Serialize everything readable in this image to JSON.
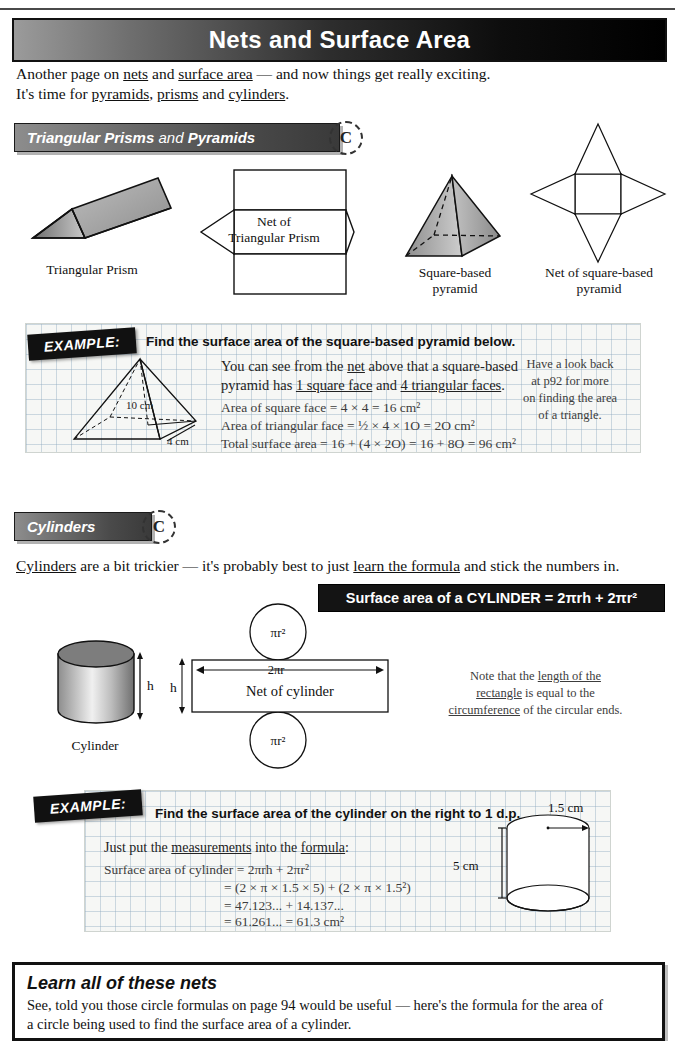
{
  "page": {
    "title": "Nets and Surface Area"
  },
  "intro": {
    "line1_a": "Another page on ",
    "line1_nets": "nets",
    "line1_b": " and ",
    "line1_sa": "surface area",
    "line1_c": " — and now things get really exciting.",
    "line2_a": "It's time for ",
    "line2_pyramids": "pyramids",
    "line2_b": ", ",
    "line2_prisms": "prisms",
    "line2_c": " and ",
    "line2_cylinders": "cylinders",
    "line2_d": "."
  },
  "section1": {
    "header_bold1": "Triangular Prisms",
    "header_light": " and ",
    "header_bold2": "Pyramids",
    "badge": "C",
    "captions": {
      "prism": "Triangular Prism",
      "net_prism_l1": "Net of",
      "net_prism_l2": "Triangular Prism",
      "pyramid_l1": "Square-based",
      "pyramid_l2": "pyramid",
      "net_pyramid_l1": "Net of square-based",
      "net_pyramid_l2": "pyramid"
    }
  },
  "example1": {
    "tag": "EXAMPLE:",
    "question": "Find the surface area of the square-based pyramid below.",
    "body_l1_a": "You can see from the ",
    "body_l1_net": "net",
    "body_l1_b": " above that a square-based",
    "body_l2_a": "pyramid has ",
    "body_l2_u1": "1 square face",
    "body_l2_b": " and ",
    "body_l2_u2": "4 triangular faces",
    "body_l2_c": ".",
    "calc1": "Area of square face = 4 × 4 = 16 cm²",
    "calc2": "Area of triangular face = ½ × 4 × 1O = 2O cm²",
    "calc3": "Total surface area = 16 + (4 × 2O) = 16 + 8O = 96 cm²",
    "sidenote_l1": "Have a look back",
    "sidenote_l2": "at p92 for more",
    "sidenote_l3": "on finding the area",
    "sidenote_l4": "of a triangle.",
    "diagram_slant": "10 cm",
    "diagram_base": "4 cm"
  },
  "section2": {
    "header": "Cylinders",
    "badge": "C",
    "intro_a": "Cylinders",
    "intro_b": " are a bit trickier — it's probably best to just ",
    "intro_c": "learn the formula",
    "intro_d": " and stick the numbers in.",
    "formula": "Surface area of a CYLINDER = 2πrh + 2πr²",
    "captions": {
      "cylinder": "Cylinder",
      "net": "Net of cylinder",
      "circle_top": "πr²",
      "circle_bottom": "πr²",
      "width": "2πr",
      "height_solid": "h",
      "height_net": "h"
    },
    "note_l1_a": "Note that the ",
    "note_l1_u": "length of the",
    "note_l2_u": "rectangle",
    "note_l2_a": " is equal to the",
    "note_l3_u": "circumference",
    "note_l3_a": " of the circular ends."
  },
  "example2": {
    "tag": "EXAMPLE:",
    "question": "Find the surface area of the cylinder on the right to 1 d.p.",
    "body_a": "Just put the ",
    "body_u1": "measurements",
    "body_b": " into the ",
    "body_u2": "formula",
    "body_c": ":",
    "calc1": "Surface area of cylinder = 2πrh + 2πr²",
    "calc2": "= (2 × π × 1.5 × 5) + (2 × π × 1.5²)",
    "calc3": "= 47.123... + 14.137...",
    "calc4": "= 61.261... = 61.3 cm²",
    "diagram_radius": "1.5 cm",
    "diagram_height": "5 cm"
  },
  "summary": {
    "heading": "Learn all of these nets",
    "text_l1": "See, told you those circle formulas on page 94 would be useful — here's the formula for the area of",
    "text_l2": "a circle being used to find the surface area of a cylinder."
  },
  "colors": {
    "banner_dark": "#0d0d0d",
    "chip_grey": "#6a6a6a",
    "grid_blue": "#96afc3",
    "shape_fill": "#9a9a9a"
  }
}
